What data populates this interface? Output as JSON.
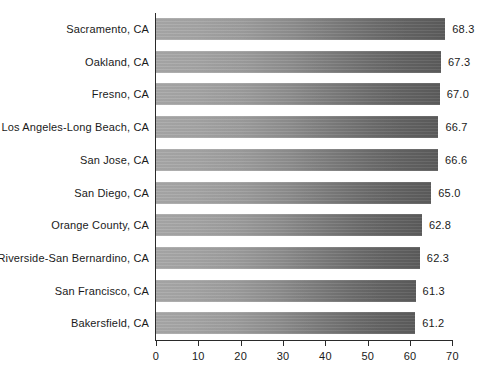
{
  "chart_data": {
    "type": "bar",
    "orientation": "horizontal",
    "title": "",
    "subtitle": "",
    "xlabel": "",
    "ylabel": "",
    "xlim": [
      0,
      70
    ],
    "xticks": [
      "0",
      "10",
      "20",
      "30",
      "40",
      "50",
      "60",
      "70"
    ],
    "xtick_values": [
      0,
      10,
      20,
      30,
      40,
      50,
      60,
      70
    ],
    "grid": false,
    "legend": null,
    "bar_color_start": "#a9a9a9",
    "bar_color_end": "#5c5c5c",
    "axis_color": "#2a2a2a",
    "text_color": "#1a1a1a",
    "background": "#ffffff",
    "categories": [
      "Sacramento, CA",
      "Oakland, CA",
      "Fresno, CA",
      "Los Angeles-Long Beach, CA",
      "San Jose, CA",
      "San Diego, CA",
      "Orange County, CA",
      "Riverside-San Bernardino, CA",
      "San Francisco, CA",
      "Bakersfield, CA"
    ],
    "values": [
      68.3,
      67.3,
      67.0,
      66.7,
      66.6,
      65.0,
      62.8,
      62.3,
      61.3,
      61.2
    ],
    "value_labels": [
      "68.3",
      "67.3",
      "67.0",
      "66.7",
      "66.6",
      "65.0",
      "62.8",
      "62.3",
      "61.3",
      "61.2"
    ]
  }
}
